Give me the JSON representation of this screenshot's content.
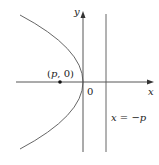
{
  "axes": {
    "x_label": "x",
    "y_label": "y",
    "origin_label": "0"
  },
  "focus": {
    "label": "(p, 0)",
    "label_open": "(",
    "label_p": "p",
    "label_rest": ", 0)"
  },
  "directrix": {
    "label": "x = −p",
    "label_x": "x",
    "label_eq": " = −",
    "label_p": "p"
  },
  "colors": {
    "curve": "#555555",
    "axis": "#444444",
    "text": "#222222"
  }
}
